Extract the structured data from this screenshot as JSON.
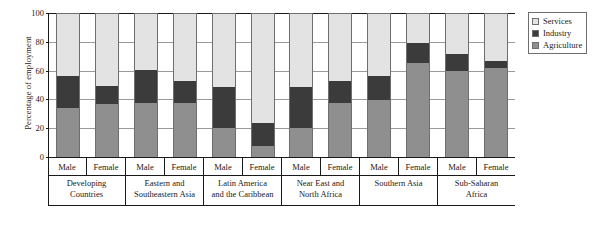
{
  "chart_data": {
    "type": "bar",
    "title": "",
    "subtitle": "",
    "xlabel": "",
    "ylabel": "Percentage of employment",
    "ylim": [
      0,
      100
    ],
    "yticks": [
      0,
      20,
      40,
      60,
      80,
      100
    ],
    "grid": true,
    "stacked": true,
    "legend_position": "right-top",
    "legend": [
      "Services",
      "Industry",
      "Agriculture"
    ],
    "categories": [
      "Developing Countries - Male",
      "Developing Countries - Female",
      "Eastern and Southeastern Asia - Male",
      "Eastern and Southeastern Asia - Female",
      "Latin America and the Caribbean - Male",
      "Latin America and the Caribbean - Female",
      "Near East and North Africa - Male",
      "Near East and North Africa - Female",
      "Southern Asia - Male",
      "Southern Asia - Female",
      "Sub-Saharan Africa - Male",
      "Sub-Saharan Africa - Female"
    ],
    "series": [
      {
        "name": "Agriculture",
        "color": "#8f8f8f",
        "values": [
          34,
          37,
          38,
          38,
          20,
          8,
          20,
          38,
          40,
          66,
          60,
          62
        ]
      },
      {
        "name": "Industry",
        "color": "#3b3b3b",
        "values": [
          23,
          13,
          23,
          15,
          29,
          16,
          29,
          15,
          17,
          14,
          12,
          5
        ]
      },
      {
        "name": "Services",
        "color": "#e3e3e3",
        "values": [
          43,
          50,
          39,
          47,
          51,
          76,
          51,
          47,
          43,
          20,
          28,
          33
        ]
      }
    ]
  },
  "axis": {
    "y_title": "Percentage of employment",
    "y_ticks": [
      "100",
      "80",
      "60",
      "40",
      "20",
      "0"
    ]
  },
  "legend": {
    "items": [
      {
        "label": "Services",
        "color": "#e3e3e3"
      },
      {
        "label": "Industry",
        "color": "#3b3b3b"
      },
      {
        "label": "Agriculture",
        "color": "#8f8f8f"
      }
    ]
  },
  "groups": [
    {
      "region_line1": "Developing",
      "region_line2": "Countries",
      "bars": [
        {
          "sex": "Male",
          "agriculture": 34,
          "industry": 23,
          "services": 43
        },
        {
          "sex": "Female",
          "agriculture": 37,
          "industry": 13,
          "services": 50
        }
      ]
    },
    {
      "region_line1": "Eastern and",
      "region_line2": "Southeastern Asia",
      "bars": [
        {
          "sex": "Male",
          "agriculture": 38,
          "industry": 23,
          "services": 39
        },
        {
          "sex": "Female",
          "agriculture": 38,
          "industry": 15,
          "services": 47
        }
      ]
    },
    {
      "region_line1": "Latin America",
      "region_line2": "and the Caribbean",
      "bars": [
        {
          "sex": "Male",
          "agriculture": 20,
          "industry": 29,
          "services": 51
        },
        {
          "sex": "Female",
          "agriculture": 8,
          "industry": 16,
          "services": 76
        }
      ]
    },
    {
      "region_line1": "Near East and",
      "region_line2": "North Africa",
      "bars": [
        {
          "sex": "Male",
          "agriculture": 20,
          "industry": 29,
          "services": 51
        },
        {
          "sex": "Female",
          "agriculture": 38,
          "industry": 15,
          "services": 47
        }
      ]
    },
    {
      "region_line1": "Southern Asia",
      "region_line2": "",
      "bars": [
        {
          "sex": "Male",
          "agriculture": 40,
          "industry": 17,
          "services": 43
        },
        {
          "sex": "Female",
          "agriculture": 66,
          "industry": 14,
          "services": 20
        }
      ]
    },
    {
      "region_line1": "Sub-Saharan",
      "region_line2": "Africa",
      "bars": [
        {
          "sex": "Male",
          "agriculture": 60,
          "industry": 12,
          "services": 28
        },
        {
          "sex": "Female",
          "agriculture": 62,
          "industry": 5,
          "services": 33
        }
      ]
    }
  ]
}
